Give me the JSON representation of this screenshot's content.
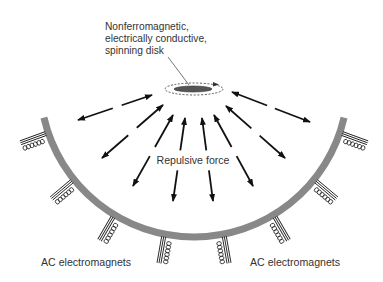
{
  "labels": {
    "disk_line1": "Nonferromagnetic,",
    "disk_line2": "electrically conductive,",
    "disk_line3": "spinning disk",
    "force": "Repulsive force",
    "magnets_left": "AC electromagnets",
    "magnets_right": "AC electromagnets"
  },
  "colors": {
    "background": "#ffffff",
    "text": "#333333",
    "arc": "#888888",
    "arrow": "#111111",
    "disk": "#555555",
    "magnet": "#222222"
  },
  "diagram": {
    "arc": {
      "cx": 194,
      "cy": 83,
      "r": 154,
      "start_deg": 167,
      "end_deg": 13,
      "width": 7
    },
    "disk": {
      "cx": 193,
      "cy": 89,
      "rx": 19,
      "ry": 3
    },
    "spin_path": {
      "cx": 194,
      "cy": 89,
      "rx": 29,
      "ry": 6
    },
    "leader": {
      "x1": 168,
      "y1": 57,
      "x2": 189,
      "y2": 85
    },
    "arrows": [
      {
        "inner": [
          152,
          95
        ],
        "outer": [
          78,
          120
        ],
        "gap": [
          0.41,
          0.53
        ]
      },
      {
        "inner": [
          163,
          105
        ],
        "outer": [
          102,
          158
        ],
        "gap": [
          0.43,
          0.57
        ]
      },
      {
        "inner": [
          173,
          115
        ],
        "outer": [
          133,
          186
        ],
        "gap": [
          0.45,
          0.58
        ]
      },
      {
        "inner": [
          185,
          118
        ],
        "outer": [
          173,
          201
        ],
        "gap": [
          0.39,
          0.63
        ]
      },
      {
        "inner": [
          202,
          118
        ],
        "outer": [
          213,
          201
        ],
        "gap": [
          0.39,
          0.63
        ]
      },
      {
        "inner": [
          214,
          115
        ],
        "outer": [
          253,
          186
        ],
        "gap": [
          0.45,
          0.58
        ]
      },
      {
        "inner": [
          226,
          106
        ],
        "outer": [
          285,
          158
        ],
        "gap": [
          0.43,
          0.57
        ]
      },
      {
        "inner": [
          232,
          92
        ],
        "outer": [
          310,
          122
        ],
        "gap": [
          0.45,
          0.55
        ]
      }
    ],
    "magnets": [
      {
        "angle_deg": 160
      },
      {
        "angle_deg": 140
      },
      {
        "angle_deg": 120
      },
      {
        "angle_deg": 100
      },
      {
        "angle_deg": 80
      },
      {
        "angle_deg": 60
      },
      {
        "angle_deg": 40
      },
      {
        "angle_deg": 20
      }
    ]
  }
}
